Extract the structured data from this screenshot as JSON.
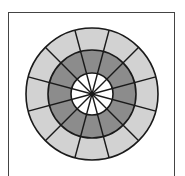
{
  "diagram": {
    "type": "concentric-sector-wheel",
    "center": [
      92,
      94
    ],
    "sectors": 12,
    "rings": [
      {
        "name": "outer",
        "radius": 66,
        "fill": "#d2d2d2"
      },
      {
        "name": "middle",
        "radius": 44,
        "fill": "#8c8c8c"
      },
      {
        "name": "inner",
        "radius": 21,
        "fill": "#ffffff"
      }
    ],
    "stroke": "#1a1a1a"
  }
}
